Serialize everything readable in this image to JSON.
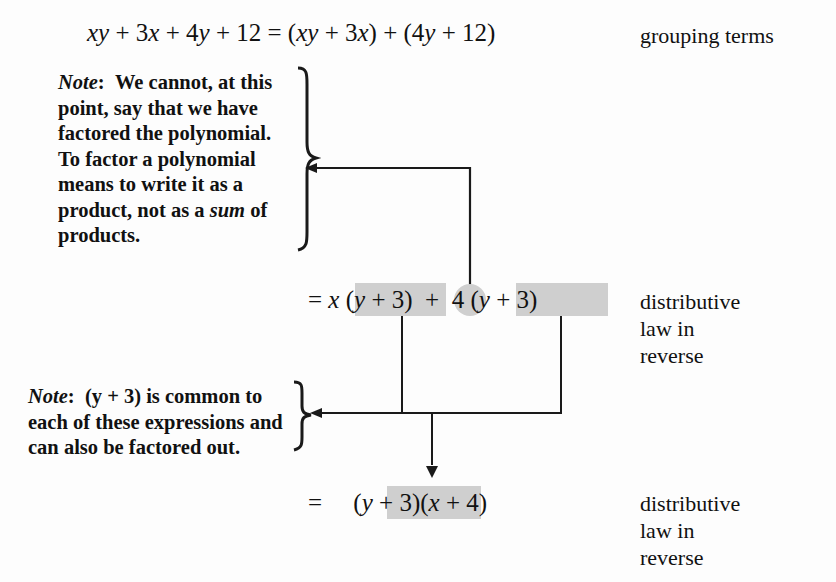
{
  "page": {
    "width": 836,
    "height": 582,
    "background": "#fdfdfd",
    "ink": "#1a1a1a",
    "highlight_color": "#cfcfcf"
  },
  "equations": {
    "line1": {
      "lhs": "xy + 3x + 4y + 12",
      "equals": "=",
      "rhs": "(xy + 3x) + (4y + 12)",
      "full": "xy + 3x + 4y + 12 = (xy + 3x) + (4y + 12)",
      "right_label": "grouping terms"
    },
    "line2": {
      "equals": "=",
      "coef1": "x",
      "group1": "(y + 3)",
      "plus": "+",
      "coef2": "4",
      "group2": "(y + 3)",
      "full": "= x (y + 3) + 4 (y + 3)",
      "right_label": "distributive\nlaw in\nreverse"
    },
    "line3": {
      "equals": "=",
      "group1": "(y + 3)",
      "group2": "(x + 4)",
      "full": "= (y + 3)(x + 4)",
      "right_label": "distributive\nlaw in\nreverse"
    }
  },
  "notes": {
    "note1": {
      "tag": "Note",
      "colon": ":",
      "lines": [
        "We cannot, at this",
        "point, say that we have",
        "factored the polynomial.",
        "To factor a polynomial",
        "means to write it as a",
        "product, not as a sum of",
        "products."
      ],
      "emphasis_word": "sum",
      "text": "We cannot, at this point, say that we have factored the polynomial. To factor a polynomial means to write it as a product, not as a sum of products."
    },
    "note2": {
      "tag": "Note",
      "colon": ":",
      "lines": [
        "(y + 3) is common to",
        "each of these expressions and",
        "can also be factored out."
      ],
      "text": "(y + 3) is common to each of these expressions and can also be factored out."
    }
  },
  "connectors": {
    "plus_to_note1": "arrow-from-plus-sign-up-and-left-to-note1-brace",
    "groups_to_note2": "arrow-from-both-y-plus-3-groups-down-and-left-to-note2-brace",
    "groups_to_result": "arrow-down-to-factored-result"
  }
}
